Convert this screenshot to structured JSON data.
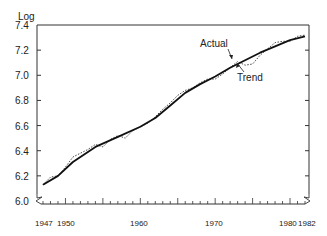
{
  "chart_data": {
    "type": "line",
    "title": "",
    "ylabel": "Log",
    "xlabel": "",
    "ylim": [
      6.0,
      7.4
    ],
    "xlim": [
      1947,
      1982
    ],
    "y_ticks": [
      "6.0",
      "6.2",
      "6.4",
      "6.6",
      "6.8",
      "7.0",
      "7.2",
      "7.4"
    ],
    "x_tick_labels": [
      "1947",
      "1950",
      "1960",
      "1970",
      "1980",
      "1982"
    ],
    "grid": false,
    "annotations": [
      "Actual",
      "Trend"
    ],
    "series": [
      {
        "name": "Trend",
        "style": "solid",
        "x": [
          1947,
          1949,
          1951,
          1954,
          1957,
          1960,
          1962,
          1964,
          1966,
          1968,
          1970,
          1972,
          1974,
          1976,
          1978,
          1980,
          1982
        ],
        "values": [
          6.13,
          6.2,
          6.31,
          6.43,
          6.51,
          6.59,
          6.66,
          6.76,
          6.86,
          6.93,
          6.99,
          7.06,
          7.12,
          7.18,
          7.23,
          7.28,
          7.31
        ]
      },
      {
        "name": "Actual",
        "style": "dotted",
        "x": [
          1947,
          1948,
          1949,
          1950,
          1951,
          1952,
          1953,
          1954,
          1955,
          1956,
          1957,
          1958,
          1959,
          1960,
          1961,
          1962,
          1963,
          1964,
          1965,
          1966,
          1967,
          1968,
          1969,
          1970,
          1971,
          1972,
          1973,
          1974,
          1975,
          1976,
          1977,
          1978,
          1979,
          1980,
          1981,
          1982
        ],
        "values": [
          6.13,
          6.19,
          6.2,
          6.27,
          6.35,
          6.38,
          6.41,
          6.45,
          6.43,
          6.49,
          6.52,
          6.5,
          6.56,
          6.59,
          6.62,
          6.67,
          6.73,
          6.78,
          6.84,
          6.88,
          6.9,
          6.94,
          6.97,
          6.97,
          7.01,
          7.06,
          7.11,
          7.08,
          7.09,
          7.16,
          7.21,
          7.26,
          7.27,
          7.27,
          7.31,
          7.32
        ]
      }
    ]
  },
  "labels": {
    "ylabel": "Log",
    "actual": "Actual",
    "trend": "Trend",
    "yt0": "6.0",
    "yt1": "6.2",
    "yt2": "6.4",
    "yt3": "6.6",
    "yt4": "6.8",
    "yt5": "7.0",
    "yt6": "7.2",
    "yt7": "7.4",
    "xt0": "1947",
    "xt1": "1950",
    "xt2": "1960",
    "xt3": "1970",
    "xt4": "1980",
    "xt5": "1982"
  }
}
